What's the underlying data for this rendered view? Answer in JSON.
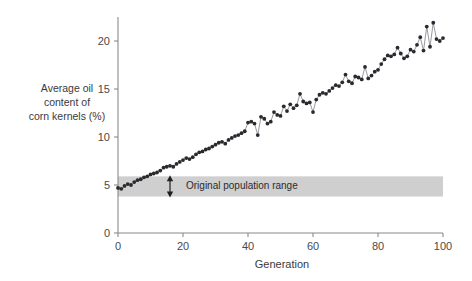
{
  "chart_data": {
    "type": "line",
    "title": "",
    "xlabel": "Generation",
    "ylabel": "Average oil content of corn kernels (%)",
    "ylabel_lines": [
      "Average oil",
      "content of",
      "corn kernels (%)"
    ],
    "xlim": [
      0,
      100
    ],
    "ylim": [
      0,
      22.5
    ],
    "xticks": [
      0,
      20,
      40,
      60,
      80,
      100
    ],
    "yticks": [
      0,
      5,
      10,
      15,
      20
    ],
    "xtick_labels": [
      "0",
      "20",
      "40",
      "60",
      "80",
      "100"
    ],
    "ytick_labels": [
      "0",
      "5",
      "10",
      "15",
      "20"
    ],
    "grid": false,
    "legend": null,
    "marker": "filled-circle",
    "line_color": "#8c8c94",
    "marker_color": "#2a2a2e",
    "annotations": [
      {
        "name": "original-population-range",
        "label": "Original population range",
        "type": "horizontal-band",
        "y_low": 3.8,
        "y_high": 5.9,
        "x_start": 0,
        "x_end": 100,
        "color": "#cfcfcf",
        "arrow": "double-headed-vertical",
        "arrow_x": 16
      }
    ],
    "x": [
      0,
      1,
      2,
      3,
      4,
      5,
      6,
      7,
      8,
      9,
      10,
      11,
      12,
      13,
      14,
      15,
      16,
      17,
      18,
      19,
      20,
      21,
      22,
      23,
      24,
      25,
      26,
      27,
      28,
      29,
      30,
      31,
      32,
      33,
      34,
      35,
      36,
      37,
      38,
      39,
      40,
      41,
      42,
      43,
      44,
      45,
      46,
      47,
      48,
      49,
      50,
      51,
      52,
      53,
      54,
      55,
      56,
      57,
      58,
      59,
      60,
      61,
      62,
      63,
      64,
      65,
      66,
      67,
      68,
      69,
      70,
      71,
      72,
      73,
      74,
      75,
      76,
      77,
      78,
      79,
      80,
      81,
      82,
      83,
      84,
      85,
      86,
      87,
      88,
      89,
      90,
      91,
      92,
      93,
      94,
      95,
      96,
      97,
      98,
      99,
      100
    ],
    "values": [
      4.7,
      4.6,
      4.9,
      5.1,
      5.0,
      5.3,
      5.5,
      5.6,
      5.8,
      5.9,
      6.1,
      6.2,
      6.3,
      6.5,
      6.8,
      6.9,
      7.0,
      6.9,
      7.2,
      7.4,
      7.6,
      7.8,
      7.7,
      7.9,
      8.2,
      8.4,
      8.5,
      8.7,
      8.8,
      9.0,
      9.2,
      9.4,
      9.5,
      9.3,
      9.7,
      9.9,
      10.1,
      10.2,
      10.4,
      10.6,
      11.5,
      11.6,
      11.4,
      10.2,
      12.1,
      11.9,
      11.4,
      11.6,
      12.6,
      12.3,
      12.2,
      13.2,
      12.7,
      13.4,
      13.0,
      13.3,
      14.5,
      13.7,
      13.5,
      13.6,
      12.6,
      13.9,
      14.4,
      14.6,
      14.5,
      14.8,
      15.1,
      15.4,
      15.3,
      15.7,
      16.5,
      15.8,
      15.6,
      16.3,
      16.2,
      16.0,
      17.3,
      16.1,
      16.4,
      16.8,
      17.0,
      17.6,
      18.1,
      18.5,
      18.4,
      18.6,
      19.3,
      18.7,
      18.2,
      18.4,
      19.1,
      18.9,
      19.6,
      20.4,
      19.0,
      21.5,
      19.4,
      21.9,
      20.2,
      20.0,
      20.3
    ]
  },
  "axes": {
    "y_axis_name": "oil-content-axis",
    "x_axis_name": "generation-axis"
  }
}
